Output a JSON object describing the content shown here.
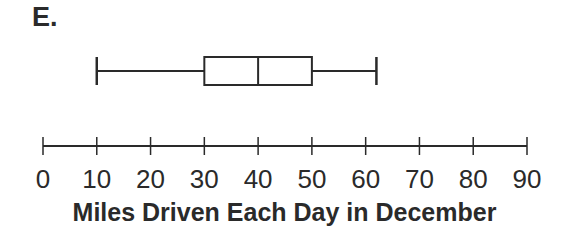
{
  "figure_label": "E.",
  "chart_data": {
    "type": "boxplot",
    "title": "",
    "xlabel": "Miles Driven Each Day in December",
    "ylabel": "",
    "xlim": [
      0,
      90
    ],
    "ticks": [
      0,
      10,
      20,
      30,
      40,
      50,
      60,
      70,
      80,
      90
    ],
    "tick_labels": [
      "0",
      "10",
      "20",
      "30",
      "40",
      "50",
      "60",
      "70",
      "80",
      "90"
    ],
    "grid": false,
    "legend": null,
    "boxplot": {
      "min": 10,
      "q1": 30,
      "median": 40,
      "q3": 50,
      "max": 62
    },
    "color": "#2a2a2a"
  }
}
